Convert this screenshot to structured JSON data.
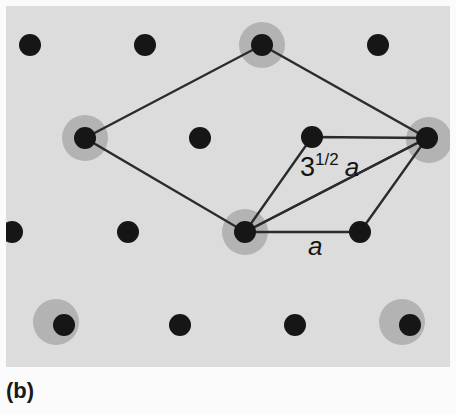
{
  "figure": {
    "caption": "(b)",
    "panel_background": "#dcdcdc",
    "page_background": "#fbfbfb",
    "panel": {
      "x": 6,
      "y": 6,
      "width": 444,
      "height": 361
    },
    "colors": {
      "atom_dark": "#161616",
      "atom_halo": "#b3b3b3",
      "line": "#2b2b2b"
    }
  },
  "labels": [
    {
      "name": "sqrt3-a-label",
      "base": "3",
      "superscript": "1/2",
      "italic": "a",
      "x": 300,
      "y": 176
    },
    {
      "name": "a-label",
      "italic": "a",
      "x": 308,
      "y": 255
    }
  ],
  "chart_data": {
    "type": "scatter",
    "title": "(b)",
    "xlabel": "",
    "ylabel": "",
    "xlim": [
      0,
      456
    ],
    "ylim": [
      0,
      414
    ],
    "grid": false,
    "legend": null,
    "series": [
      {
        "name": "substrate-atoms",
        "marker": "filled-circle",
        "color": "#161616",
        "radius": 11,
        "points": [
          {
            "x": 30,
            "y": 45
          },
          {
            "x": 145,
            "y": 45
          },
          {
            "x": 262,
            "y": 45
          },
          {
            "x": 378,
            "y": 45
          },
          {
            "x": 85,
            "y": 138
          },
          {
            "x": 200,
            "y": 138
          },
          {
            "x": 312,
            "y": 137
          },
          {
            "x": 427,
            "y": 138
          },
          {
            "x": 12,
            "y": 232
          },
          {
            "x": 128,
            "y": 232
          },
          {
            "x": 245,
            "y": 232
          },
          {
            "x": 360,
            "y": 232
          },
          {
            "x": 64,
            "y": 325
          },
          {
            "x": 180,
            "y": 325
          },
          {
            "x": 295,
            "y": 325
          },
          {
            "x": 410,
            "y": 325
          }
        ]
      },
      {
        "name": "adsorbate-halos",
        "marker": "filled-circle",
        "color": "#b3b3b3",
        "radius": 23,
        "points": [
          {
            "x": 262,
            "y": 45
          },
          {
            "x": 85,
            "y": 138
          },
          {
            "x": 429,
            "y": 140
          },
          {
            "x": 245,
            "y": 232
          },
          {
            "x": 56,
            "y": 322
          },
          {
            "x": 402,
            "y": 322
          }
        ]
      }
    ],
    "annotations": [
      {
        "name": "superlattice-cell",
        "type": "polygon",
        "label": "3^1/2 a unit cell",
        "vertices": [
          {
            "x": 262,
            "y": 45
          },
          {
            "x": 427,
            "y": 138
          },
          {
            "x": 245,
            "y": 232
          },
          {
            "x": 85,
            "y": 138
          }
        ]
      },
      {
        "name": "substrate-cell",
        "type": "polygon",
        "label": "a unit cell",
        "vertices": [
          {
            "x": 312,
            "y": 137
          },
          {
            "x": 427,
            "y": 138
          },
          {
            "x": 360,
            "y": 232
          },
          {
            "x": 245,
            "y": 232
          }
        ]
      },
      {
        "name": "cell-diagonal",
        "type": "line",
        "from": {
          "x": 245,
          "y": 232
        },
        "to": {
          "x": 427,
          "y": 138
        }
      }
    ]
  }
}
